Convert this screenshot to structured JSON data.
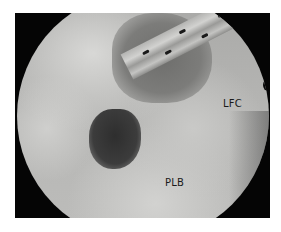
{
  "image": {
    "description": "Grayscale arthroscopic view with instrument",
    "labels": {
      "lfc": "LFC",
      "plb": "PLB"
    },
    "colors": {
      "background": "#ffffff",
      "frame": "#050505",
      "tissue_light": "#d2d2d0",
      "tissue_mid": "#b0b0ae",
      "lesion_dark": "#2e2e2e",
      "label_text": "#1a1a1a"
    }
  }
}
